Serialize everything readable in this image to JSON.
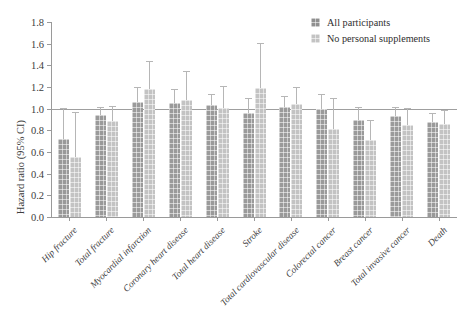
{
  "chart_data": {
    "type": "bar",
    "title": "",
    "xlabel": "",
    "ylabel": "Hazard ratio (95% CI)",
    "ylim": [
      0.0,
      1.8
    ],
    "ytick_labels": [
      "0.0",
      "0.2",
      "0.4",
      "0.6",
      "0.8",
      "1.0",
      "1.2",
      "1.4",
      "1.6",
      "1.8"
    ],
    "ytick_values": [
      0.0,
      0.2,
      0.4,
      0.6,
      0.8,
      1.0,
      1.2,
      1.4,
      1.6,
      1.8
    ],
    "grid": false,
    "reference_line": 1.0,
    "legend_position": "top-right",
    "categories": [
      "Hip fracture",
      "Total fracture",
      "Myocardial infarction",
      "Coronary heart disease",
      "Total heart disease",
      "Stroke",
      "Total cardiovascular disease",
      "Colorectal cancer",
      "Breast cancer",
      "Total invasive cancer",
      "Death"
    ],
    "series": [
      {
        "name": "All participants",
        "color": "#9a9a9a",
        "values": [
          0.72,
          0.94,
          1.06,
          1.05,
          1.03,
          0.96,
          1.02,
          1.0,
          0.9,
          0.93,
          0.88
        ],
        "ci_low": [
          0.58,
          0.86,
          0.96,
          0.96,
          0.95,
          0.87,
          0.96,
          0.9,
          0.81,
          0.87,
          0.83
        ],
        "ci_high": [
          1.0,
          1.01,
          1.19,
          1.17,
          1.13,
          1.09,
          1.11,
          1.13,
          1.01,
          1.01,
          0.95
        ]
      },
      {
        "name": "No personal supplements",
        "color": "#c3c3c3",
        "values": [
          0.55,
          0.89,
          1.18,
          1.08,
          1.01,
          1.19,
          1.04,
          0.81,
          0.71,
          0.85,
          0.86
        ],
        "ci_low": [
          0.36,
          0.79,
          0.99,
          0.9,
          0.87,
          0.9,
          0.92,
          0.62,
          0.58,
          0.74,
          0.77
        ],
        "ci_high": [
          0.96,
          1.02,
          1.43,
          1.34,
          1.2,
          1.6,
          1.19,
          1.09,
          0.89,
          1.0,
          0.98
        ]
      }
    ]
  },
  "legend": {
    "entries": [
      {
        "label": "All participants"
      },
      {
        "label": "No personal supplements"
      }
    ]
  }
}
